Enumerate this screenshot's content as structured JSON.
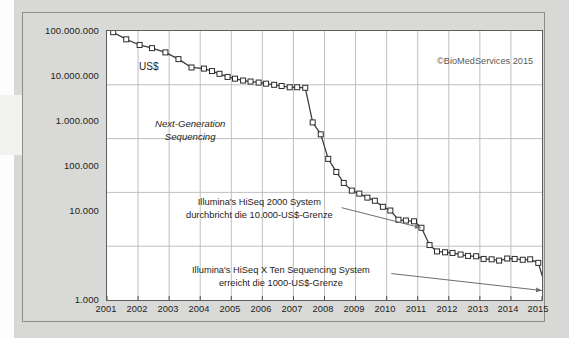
{
  "figure": {
    "currency_label": "US$",
    "credit": "©BioMedServices 2015",
    "series_label_line1": "Next-Generation",
    "series_label_line2": "Sequencing",
    "annotation_1_line1": "Illumina's HiSeq 2000 System",
    "annotation_1_line2": "durchbricht die 10.000-US$-Grenze",
    "annotation_2_line1": "Illumina's HiSeq X Ten Sequencing System",
    "annotation_2_line2": "erreicht die 1000-US$-Grenze",
    "colors": {
      "line": "#3a3a38",
      "marker_fill": "#ffffff",
      "marker_stroke": "#2b2b29",
      "grid": "#b9b9b7",
      "axis": "#4a4a48",
      "plot_bg": "#ffffff",
      "figure_bg": "#d9d9d7",
      "page_bg": "#d8d8d6",
      "arrow": "#6e6e6c",
      "text": "#1d1d1b"
    }
  },
  "chart_data": {
    "type": "line",
    "title": "",
    "subtitle": "",
    "xlabel": "",
    "ylabel": "US$",
    "yscale": "log",
    "ylim": [
      1000,
      100000000
    ],
    "xlim": [
      2001,
      2015
    ],
    "grid": true,
    "legend": "none",
    "ytick_labels": [
      "100.000.000",
      "10.000.000",
      "1.000.000",
      "100.000",
      "10.000",
      "1.000"
    ],
    "ytick_values": [
      100000000,
      10000000,
      1000000,
      100000,
      10000,
      1000
    ],
    "xtick_labels": [
      "2001",
      "2002",
      "2003",
      "2004",
      "2005",
      "2006",
      "2007",
      "2008",
      "2009",
      "2010",
      "2011",
      "2012",
      "2013",
      "2014",
      "2015"
    ],
    "xtick_values": [
      2001,
      2002,
      2003,
      2004,
      2005,
      2006,
      2007,
      2008,
      2009,
      2010,
      2011,
      2012,
      2013,
      2014,
      2015
    ],
    "series": [
      {
        "name": "Kosten der Sequenzierung eines humanen Genoms",
        "x": [
          2001.2,
          2001.62,
          2002.05,
          2002.45,
          2002.88,
          2003.3,
          2003.72,
          2004.12,
          2004.38,
          2004.62,
          2004.88,
          2005.12,
          2005.38,
          2005.62,
          2005.88,
          2006.12,
          2006.38,
          2006.62,
          2006.88,
          2007.12,
          2007.38,
          2007.62,
          2007.88,
          2008.12,
          2008.38,
          2008.62,
          2008.88,
          2009.12,
          2009.38,
          2009.62,
          2009.88,
          2010.12,
          2010.38,
          2010.62,
          2010.88,
          2011.12,
          2011.38,
          2011.62,
          2011.88,
          2012.12,
          2012.38,
          2012.62,
          2012.88,
          2013.12,
          2013.38,
          2013.62,
          2013.88,
          2014.12,
          2014.38,
          2014.62,
          2014.88,
          2015.2
        ],
        "y": [
          95000000,
          70000000,
          55000000,
          48000000,
          40000000,
          30000000,
          21000000,
          20000000,
          18000000,
          16000000,
          14000000,
          13000000,
          12000000,
          11500000,
          11000000,
          10500000,
          10000000,
          9500000,
          9000000,
          9000000,
          8800000,
          2000000,
          1200000,
          420000,
          240000,
          150000,
          108000,
          95000,
          80000,
          70000,
          54000,
          46000,
          31000,
          30000,
          29000,
          22000,
          10500,
          8000,
          7700,
          7500,
          7000,
          6600,
          6500,
          5800,
          5700,
          5400,
          5900,
          5800,
          5600,
          5700,
          4900,
          1200
        ]
      }
    ],
    "annotations": [
      {
        "text": "Illumina's HiSeq 2000 System durchbricht die 10.000-US$-Grenze",
        "points_to_x": 2011.1,
        "points_to_y": 22000
      },
      {
        "text": "Illumina's HiSeq X Ten Sequencing System erreicht die 1000-US$-Grenze",
        "points_to_x": 2015.0,
        "points_to_y": 1500
      }
    ]
  }
}
